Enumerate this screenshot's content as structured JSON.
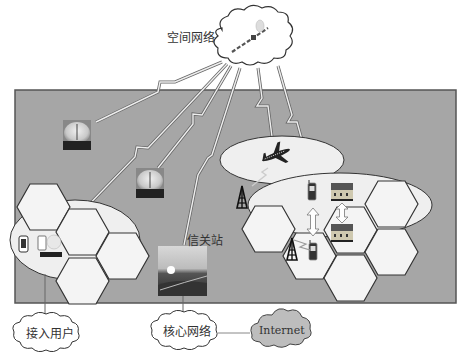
{
  "diagram": {
    "type": "network-architecture",
    "colors": {
      "background": "#ffffff",
      "panel": "#a6a6a6",
      "panel_border": "#555555",
      "cell_fill": "#f4f4f4",
      "cell_stroke": "#333333",
      "link": "#e8e8e8",
      "internet_cloud": "#bdbdbd"
    },
    "labels": {
      "space_network": "空间网络",
      "gateway": "信关站",
      "access_users": "接入用户",
      "core_network": "核心网络",
      "internet": "Internet"
    },
    "nodes": [
      {
        "id": "space-network",
        "label": "空间网络",
        "shape": "cloud",
        "icon": "satellite-icon"
      },
      {
        "id": "ground-station-1",
        "icon": "satellite-dish-icon"
      },
      {
        "id": "ground-station-2",
        "icon": "satellite-dish-icon"
      },
      {
        "id": "aircraft",
        "icon": "airplane-icon",
        "zone": "ellipse"
      },
      {
        "id": "gateway",
        "label": "信关站",
        "icon": "gateway-photo"
      },
      {
        "id": "left-cell-cluster",
        "cells": 4,
        "devices": [
          "phone-icon",
          "laptop-icon"
        ]
      },
      {
        "id": "right-cell-cluster",
        "cells": 6,
        "devices": [
          "phone-icon",
          "phone-icon",
          "building-icon",
          "building-icon",
          "cell-tower-icon"
        ]
      },
      {
        "id": "access-users",
        "label": "接入用户",
        "shape": "cloud"
      },
      {
        "id": "core-network",
        "label": "核心网络",
        "shape": "cloud"
      },
      {
        "id": "internet",
        "label": "Internet",
        "shape": "cloud"
      }
    ],
    "edges": [
      {
        "from": "space-network",
        "to": "ground-station-1",
        "style": "lightning"
      },
      {
        "from": "space-network",
        "to": "left-cell-cluster",
        "style": "lightning"
      },
      {
        "from": "space-network",
        "to": "ground-station-2",
        "style": "line"
      },
      {
        "from": "space-network",
        "to": "gateway",
        "style": "line"
      },
      {
        "from": "space-network",
        "to": "aircraft",
        "style": "lightning"
      },
      {
        "from": "space-network",
        "to": "right-cell-cluster",
        "style": "lightning"
      },
      {
        "from": "aircraft",
        "to": "cell-tower",
        "style": "lightning"
      },
      {
        "from": "left-cell-cluster",
        "to": "access-users",
        "style": "line"
      },
      {
        "from": "gateway",
        "to": "core-network",
        "style": "line"
      },
      {
        "from": "core-network",
        "to": "internet",
        "style": "line"
      }
    ]
  }
}
